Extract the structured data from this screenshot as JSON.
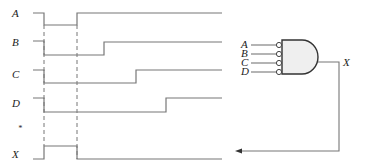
{
  "diagram": {
    "type": "timing-diagram-with-logic-gate",
    "waveforms": [
      {
        "name": "A",
        "label": "A"
      },
      {
        "name": "B",
        "label": "B"
      },
      {
        "name": "C",
        "label": "C"
      },
      {
        "name": "D",
        "label": "D"
      },
      {
        "name": "star",
        "label": "*"
      },
      {
        "name": "X",
        "label": "X"
      }
    ],
    "gate": {
      "type": "AND with inverted inputs",
      "inputs": [
        "A",
        "B",
        "C",
        "D"
      ],
      "output": "X"
    }
  }
}
